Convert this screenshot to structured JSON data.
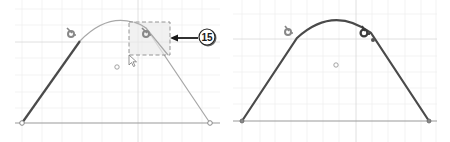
{
  "figure": {
    "panels": [
      {
        "id": "before",
        "description": "Sketch profile with line and arc, selection box around tangent constraint icon",
        "callout": {
          "number": "15",
          "target": "selection-box"
        },
        "selection_box": {
          "style": "dashed"
        },
        "icons": [
          "tangent-constraint-icon",
          "tangent-constraint-icon-selected",
          "arc-center-point",
          "mouse-cursor"
        ]
      },
      {
        "id": "after",
        "description": "Sketch profile after constraint, full curve highlighted",
        "icons": [
          "tangent-constraint-icon",
          "tangent-constraint-icon-active",
          "arc-center-point"
        ]
      }
    ],
    "colors": {
      "grid": "#e6e6e6",
      "grid_major": "#d6d6d6",
      "baseline": "#9a9a9a",
      "curve_light": "#a8a8a8",
      "curve_dark": "#4a4a4a",
      "selection_fill": "#ebebeb",
      "selection_stroke": "#8a8a8a",
      "callout_fill": "#ffffff",
      "callout_stroke": "#222222"
    }
  }
}
